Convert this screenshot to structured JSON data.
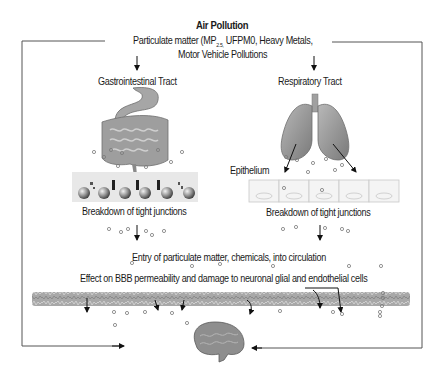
{
  "diagram": {
    "title": "Air Pollution",
    "sources_line1_prefix": "Particulate matter (MP",
    "sources_subscript": "2.5,",
    "sources_line1_suffix": " UFPM0, Heavy Metals,",
    "sources_line2": "Motor Vehicle Pollutions",
    "left_pathway": {
      "label": "Gastrointestinal Tract",
      "organ_icons": [
        "stomach-icon",
        "intestine-icon"
      ],
      "barrier_label": "Breakdown of tight junctions"
    },
    "right_pathway": {
      "label": "Respiratory Tract",
      "organ_icons": [
        "lungs-icon"
      ],
      "epithelium_label": "Epithelium",
      "barrier_label": "Breakdown of tight junctions"
    },
    "circulation_label": "Entry of particulate matter, chemicals, into circulation",
    "bbb_label": "Effect on BBB permeability and damage to neuronal glial and endothelial cells",
    "target_icon": "brain-icon",
    "colors": {
      "line": "#555555",
      "organ_gray": "#9a9a9a",
      "organ_dark": "#6e6e6e",
      "particle": "#888888",
      "text": "#1a1a1a"
    }
  }
}
